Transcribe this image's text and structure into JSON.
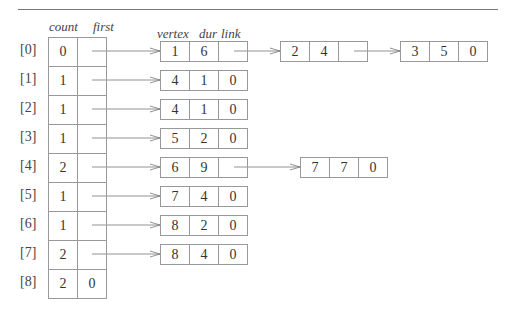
{
  "headers": {
    "count": "count",
    "first": "first",
    "vertex": "vertex",
    "dur": "dur",
    "link": "link"
  },
  "rows": [
    {
      "index": "[0]",
      "count": "0",
      "first": "",
      "nodes": [
        {
          "vertex": "1",
          "dur": "6",
          "link": ""
        },
        {
          "vertex": "2",
          "dur": "4",
          "link": ""
        },
        {
          "vertex": "3",
          "dur": "5",
          "link": "0"
        }
      ]
    },
    {
      "index": "[1]",
      "count": "1",
      "first": "",
      "nodes": [
        {
          "vertex": "4",
          "dur": "1",
          "link": "0"
        }
      ]
    },
    {
      "index": "[2]",
      "count": "1",
      "first": "",
      "nodes": [
        {
          "vertex": "4",
          "dur": "1",
          "link": "0"
        }
      ]
    },
    {
      "index": "[3]",
      "count": "1",
      "first": "",
      "nodes": [
        {
          "vertex": "5",
          "dur": "2",
          "link": "0"
        }
      ]
    },
    {
      "index": "[4]",
      "count": "2",
      "first": "",
      "nodes": [
        {
          "vertex": "6",
          "dur": "9",
          "link": ""
        },
        {
          "vertex": "7",
          "dur": "7",
          "link": "0"
        }
      ]
    },
    {
      "index": "[5]",
      "count": "1",
      "first": "",
      "nodes": [
        {
          "vertex": "7",
          "dur": "4",
          "link": "0"
        }
      ]
    },
    {
      "index": "[6]",
      "count": "1",
      "first": "",
      "nodes": [
        {
          "vertex": "8",
          "dur": "2",
          "link": "0"
        }
      ]
    },
    {
      "index": "[7]",
      "count": "2",
      "first": "",
      "nodes": [
        {
          "vertex": "8",
          "dur": "4",
          "link": "0"
        }
      ]
    },
    {
      "index": "[8]",
      "count": "2",
      "first": "0",
      "nodes": []
    }
  ]
}
